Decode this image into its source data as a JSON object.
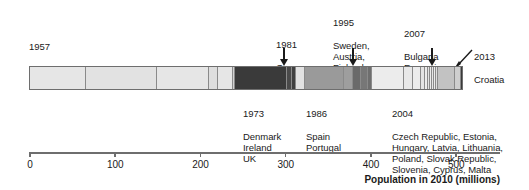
{
  "figure": {
    "axis_title": "Population in 2010 (millions)"
  },
  "annotations": [
    {
      "key": "a1957",
      "year": "1957",
      "countries": "France, West Germany, Italy,\nBelgium, Netherlands, Luxembourg",
      "position": "above-left"
    },
    {
      "key": "a1973",
      "year": "1973",
      "countries": "Denmark\nIreland\nUK",
      "position": "below"
    },
    {
      "key": "a1981",
      "year": "1981",
      "countries": "Greece",
      "position": "above"
    },
    {
      "key": "a1986",
      "year": "1986",
      "countries": "Spain\nPortugal",
      "position": "below"
    },
    {
      "key": "a1995",
      "year": "1995",
      "countries": "Sweden,\nAustria,\nFinland",
      "position": "above"
    },
    {
      "key": "a2004",
      "year": "2004",
      "countries": "Czech Republic, Estonia,\nHungary, Latvia, Lithuania,\nPoland, Slovak Republic,\nSlovenia, Cyprus, Malta",
      "position": "below"
    },
    {
      "key": "a2007",
      "year": "2007",
      "countries": "Bulgaria\nRomania",
      "position": "above"
    },
    {
      "key": "a2013",
      "year": "2013",
      "countries": "Croatia",
      "position": "above-right"
    }
  ],
  "chart_data": {
    "type": "bar",
    "orientation": "horizontal-stacked",
    "title": "",
    "xlabel": "Population in 2010 (millions)",
    "ylabel": "",
    "xlim": [
      0,
      570
    ],
    "grid": false,
    "legend": "none",
    "tick_labels": [
      "0",
      "100",
      "200",
      "300",
      "400",
      "500"
    ],
    "tick_values": [
      0,
      100,
      200,
      300,
      400,
      500
    ],
    "categories": [
      "France",
      "West Germany",
      "Italy",
      "Belgium",
      "Netherlands",
      "Luxembourg",
      "UK",
      "Denmark",
      "Ireland",
      "Greece",
      "Spain",
      "Portugal",
      "Sweden",
      "Austria",
      "Finland",
      "Poland",
      "Czech Republic",
      "Hungary",
      "Slovak Republic",
      "Lithuania",
      "Latvia",
      "Slovenia",
      "Estonia",
      "Cyprus",
      "Malta",
      "Romania",
      "Bulgaria",
      "Croatia"
    ],
    "values": [
      65,
      82,
      60,
      11,
      17,
      0.5,
      62,
      6,
      4.5,
      11,
      46,
      11,
      9,
      8,
      5,
      38,
      10,
      10,
      5,
      3,
      2,
      2,
      1.3,
      0.8,
      0.4,
      21,
      7,
      4
    ],
    "accession_groups": [
      {
        "year": 1957,
        "cumulative_end": 235
      },
      {
        "year": 1973,
        "cumulative_end": 308
      },
      {
        "year": 1981,
        "cumulative_end": 319
      },
      {
        "year": 1986,
        "cumulative_end": 376
      },
      {
        "year": 1995,
        "cumulative_end": 398
      },
      {
        "year": 2004,
        "cumulative_end": 472
      },
      {
        "year": 2007,
        "cumulative_end": 500
      },
      {
        "year": 2013,
        "cumulative_end": 504
      }
    ]
  },
  "segments": [
    {
      "width": 56,
      "shade": "#e6e6e6"
    },
    {
      "width": 71,
      "shade": "#e2e2e2"
    },
    {
      "width": 52,
      "shade": "#e6e6e6"
    },
    {
      "width": 9,
      "shade": "#dedede"
    },
    {
      "width": 15,
      "shade": "#e6e6e6"
    },
    {
      "width": 2,
      "shade": "#d2d2d2"
    },
    {
      "width": 52,
      "shade": "#3a3a3a"
    },
    {
      "width": 5,
      "shade": "#4a4a4a"
    },
    {
      "width": 4,
      "shade": "#404040"
    },
    {
      "width": 9,
      "shade": "#e2e2e2"
    },
    {
      "width": 39,
      "shade": "#9a9a9a"
    },
    {
      "width": 9,
      "shade": "#9e9e9e"
    },
    {
      "width": 8,
      "shade": "#6a6a6a"
    },
    {
      "width": 7,
      "shade": "#777777"
    },
    {
      "width": 4,
      "shade": "#6e6e6e"
    },
    {
      "width": 32,
      "shade": "#ececec"
    },
    {
      "width": 9,
      "shade": "#e8e8e8"
    },
    {
      "width": 8,
      "shade": "#ececec"
    },
    {
      "width": 4,
      "shade": "#e4e4e4"
    },
    {
      "width": 3,
      "shade": "#ececec"
    },
    {
      "width": 2,
      "shade": "#e2e2e2"
    },
    {
      "width": 2,
      "shade": "#ececec"
    },
    {
      "width": 2,
      "shade": "#e6e6e6"
    },
    {
      "width": 2,
      "shade": "#ececec"
    },
    {
      "width": 2,
      "shade": "#dedede"
    },
    {
      "width": 17,
      "shade": "#c2c2c2"
    },
    {
      "width": 6,
      "shade": "#cecece"
    },
    {
      "width": 4,
      "shade": "#3a3a3a"
    }
  ]
}
